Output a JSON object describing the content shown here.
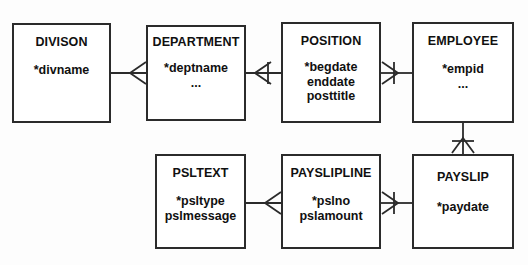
{
  "diagram": {
    "notation": "crow-foot",
    "line_color": "#2b2b2b",
    "box_fill": "#ffffff",
    "background": "#fdfdfd",
    "entities": [
      {
        "id": "division",
        "name": "DIVISON",
        "attributes": [
          "*divname"
        ]
      },
      {
        "id": "department",
        "name": "DEPARTMENT",
        "attributes": [
          "*deptname",
          "..."
        ]
      },
      {
        "id": "position",
        "name": "POSITION",
        "attributes": [
          "*begdate",
          "enddate",
          "posttitle"
        ]
      },
      {
        "id": "employee",
        "name": "EMPLOYEE",
        "attributes": [
          "*empid",
          "..."
        ]
      },
      {
        "id": "psltext",
        "name": "PSLTEXT",
        "attributes": [
          "*psltype",
          "pslmessage"
        ]
      },
      {
        "id": "paysliline",
        "name": "PAYSLIPLINE",
        "attributes": [
          "*pslno",
          "pslamount"
        ]
      },
      {
        "id": "payslip",
        "name": "PAYSLIP",
        "attributes": [
          "*paydate"
        ]
      }
    ],
    "relationships": [
      {
        "id": "division-department",
        "from": "DIVISON",
        "to": "DEPARTMENT",
        "many_end": "DEPARTMENT",
        "mandatory_tick": false
      },
      {
        "id": "department-position",
        "from": "DEPARTMENT",
        "to": "POSITION",
        "many_end": "DEPARTMENT",
        "mandatory_tick": true
      },
      {
        "id": "position-employee",
        "from": "POSITION",
        "to": "EMPLOYEE",
        "many_end": "POSITION",
        "mandatory_tick": true
      },
      {
        "id": "employee-payslip",
        "from": "EMPLOYEE",
        "to": "PAYSLIP",
        "many_end": "PAYSLIP",
        "mandatory_tick": true
      },
      {
        "id": "paysliline-payslip",
        "from": "PAYSLIPLINE",
        "to": "PAYSLIP",
        "many_end": "PAYSLIPLINE",
        "mandatory_tick": true
      },
      {
        "id": "psltext-paysliline",
        "from": "PSLTEXT",
        "to": "PAYSLIPLINE",
        "many_end": "PAYSLIPLINE",
        "mandatory_tick": false
      }
    ]
  }
}
